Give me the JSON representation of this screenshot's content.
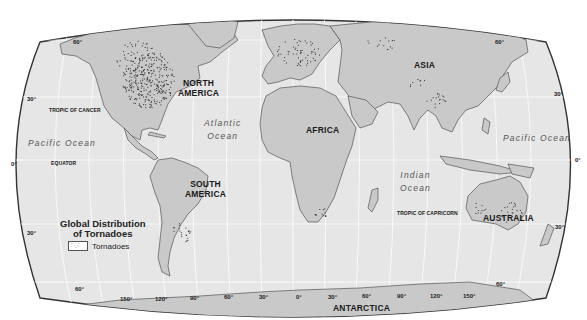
{
  "map": {
    "title_line1": "Global Distribution",
    "title_line2": "of Tornadoes",
    "legend": {
      "symbol": "⁚⁛⁚",
      "label": "Tornadoes"
    },
    "continents": {
      "north_america": [
        "NORTH",
        "AMERICA"
      ],
      "south_america": [
        "SOUTH",
        "AMERICA"
      ],
      "africa": "AFRICA",
      "asia": "ASIA",
      "australia": "AUSTRALIA",
      "antarctica": "ANTARCTICA"
    },
    "oceans": {
      "pacific_west": "Pacific Ocean",
      "pacific_east": "Pacific Ocean",
      "atlantic": [
        "Atlantic",
        "Ocean"
      ],
      "indian": [
        "Indian",
        "Ocean"
      ]
    },
    "lines": {
      "tropic_cancer": "TROPIC OF CANCER",
      "equator": "EQUATOR",
      "tropic_capricorn": "TROPIC OF CAPRICORN"
    },
    "lat_labels_left": [
      "60°",
      "30°",
      "0°",
      "30°",
      "60°"
    ],
    "lat_labels_right": [
      "60°",
      "30°",
      "0°",
      "30°",
      "60°"
    ],
    "lon_labels": [
      "150°",
      "120°",
      "90°",
      "60°",
      "30°",
      "0°",
      "30°",
      "60°",
      "90°",
      "120°",
      "150°"
    ],
    "colors": {
      "ocean": "#e6e6e6",
      "land": "#c9c9c9",
      "coast": "#555555",
      "grid": "#f7f7f7",
      "dots": "#333333"
    }
  }
}
